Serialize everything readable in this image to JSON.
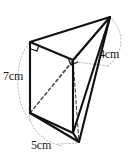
{
  "figure": {
    "kind": "geometry-figure",
    "shape_name": "triangular-prism",
    "title": "",
    "background_color": "#ffffff",
    "stroke_color": "#111111",
    "hidden_edge_color": "#555555",
    "guide_color": "#aaaaaa",
    "labels": {
      "height_label": "7cm",
      "depth_label": "4cm",
      "base_label": "5cm"
    },
    "vertices": {
      "apex_top_right": [
        110,
        17
      ],
      "top_left": [
        30,
        42
      ],
      "mid_back": [
        73,
        60
      ],
      "bottom_left": [
        30,
        113
      ],
      "bottom_mid": [
        73,
        133
      ],
      "bottom_right": [
        79,
        142
      ]
    },
    "right_angle_markers": [
      {
        "name": "right-angle-top-left",
        "at": [
          30,
          42
        ]
      },
      {
        "name": "right-angle-mid-back",
        "at": [
          73,
          60
        ]
      }
    ],
    "measurements": [
      {
        "name": "left-edge-height",
        "value": "7cm",
        "edge": "top_left-bottom_left"
      },
      {
        "name": "right-edge-depth",
        "value": "4cm",
        "edge": "apex_top_right-mid_back"
      },
      {
        "name": "bottom-edge-base",
        "value": "5cm",
        "edge": "bottom_left-bottom_right"
      }
    ]
  }
}
